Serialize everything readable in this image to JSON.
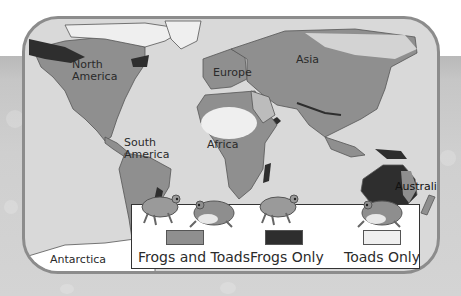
{
  "map": {
    "continents": [
      {
        "id": "north-america",
        "label_line1": "North",
        "label_line2": "America"
      },
      {
        "id": "south-america",
        "label_line1": "South",
        "label_line2": "America"
      },
      {
        "id": "europe",
        "label": "Europe"
      },
      {
        "id": "africa",
        "label": "Africa"
      },
      {
        "id": "asia",
        "label": "Asia"
      },
      {
        "id": "australia",
        "label": "Australia"
      },
      {
        "id": "antarctica",
        "label": "Antarctica"
      }
    ],
    "colors": {
      "ocean": "#d9d9d9",
      "frogs_and_toads": "#8f8f8f",
      "frogs_only": "#2e2e2e",
      "toads_only": "#efefef",
      "land_border": "#555555"
    }
  },
  "legend": {
    "items": [
      {
        "label": "Frogs and Toads",
        "swatch_color": "#8f8f8f",
        "icons": [
          "frog-icon",
          "toad-icon"
        ]
      },
      {
        "label": "Frogs Only",
        "swatch_color": "#2e2e2e",
        "icons": [
          "frog-icon"
        ]
      },
      {
        "label": "Toads Only",
        "swatch_color": "#efefef",
        "icons": [
          "toad-icon"
        ]
      }
    ]
  }
}
